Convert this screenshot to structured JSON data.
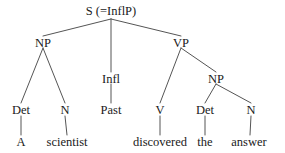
{
  "figure": {
    "kind": "syntax-tree",
    "sentence": "A scientist discovered the answer",
    "background_color": "#ffffff",
    "line_color": "#555555",
    "text_color": "#1a1a1a",
    "width": 285,
    "height": 153
  },
  "nodes": {
    "root": {
      "label": "S (=InflP)",
      "x": 111,
      "y": 11
    },
    "np_subject": {
      "label": "NP",
      "x": 43,
      "y": 43
    },
    "infl": {
      "label": "Infl",
      "x": 111,
      "y": 79
    },
    "vp": {
      "label": "VP",
      "x": 181,
      "y": 43
    },
    "det_subject": {
      "label": "Det",
      "x": 21,
      "y": 111
    },
    "n_subject": {
      "label": "N",
      "x": 65,
      "y": 111
    },
    "past": {
      "label": "Past",
      "x": 111,
      "y": 111
    },
    "v": {
      "label": "V",
      "x": 160,
      "y": 111
    },
    "np_object": {
      "label": "NP",
      "x": 216,
      "y": 79
    },
    "det_object": {
      "label": "Det",
      "x": 205,
      "y": 111
    },
    "n_object": {
      "label": "N",
      "x": 251,
      "y": 111
    },
    "word_a": {
      "label": "A",
      "x": 21,
      "y": 143
    },
    "word_scientist": {
      "label": "scientist",
      "x": 67,
      "y": 143
    },
    "word_discovered": {
      "label": "discovered",
      "x": 160,
      "y": 143
    },
    "word_the": {
      "label": "the",
      "x": 205,
      "y": 143
    },
    "word_answer": {
      "label": "answer",
      "x": 249,
      "y": 143
    }
  },
  "edges": [
    {
      "name": "s-to-np",
      "x1": 111,
      "y1": 19,
      "x2": 43,
      "y2": 36
    },
    {
      "name": "s-to-infl",
      "x1": 111,
      "y1": 19,
      "x2": 111,
      "y2": 72
    },
    {
      "name": "s-to-vp",
      "x1": 111,
      "y1": 19,
      "x2": 181,
      "y2": 36
    },
    {
      "name": "np-subject-to-det",
      "x1": 43,
      "y1": 48,
      "x2": 21,
      "y2": 103
    },
    {
      "name": "np-subject-to-n",
      "x1": 43,
      "y1": 48,
      "x2": 65,
      "y2": 103
    },
    {
      "name": "infl-to-past",
      "x1": 111,
      "y1": 84,
      "x2": 111,
      "y2": 103
    },
    {
      "name": "vp-to-v",
      "x1": 181,
      "y1": 48,
      "x2": 160,
      "y2": 103
    },
    {
      "name": "vp-to-np-object",
      "x1": 181,
      "y1": 48,
      "x2": 216,
      "y2": 72
    },
    {
      "name": "np-object-to-det",
      "x1": 216,
      "y1": 84,
      "x2": 205,
      "y2": 103
    },
    {
      "name": "np-object-to-n",
      "x1": 216,
      "y1": 84,
      "x2": 251,
      "y2": 103
    },
    {
      "name": "det-to-a",
      "x1": 21,
      "y1": 116,
      "x2": 21,
      "y2": 135
    },
    {
      "name": "n-to-scientist",
      "x1": 65,
      "y1": 116,
      "x2": 67,
      "y2": 135
    },
    {
      "name": "v-to-discovered",
      "x1": 160,
      "y1": 116,
      "x2": 160,
      "y2": 135
    },
    {
      "name": "det-to-the",
      "x1": 205,
      "y1": 116,
      "x2": 205,
      "y2": 135
    },
    {
      "name": "n-to-answer",
      "x1": 251,
      "y1": 116,
      "x2": 250,
      "y2": 135
    }
  ]
}
